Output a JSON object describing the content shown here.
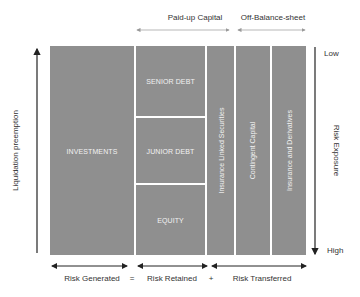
{
  "diagram": {
    "top_brackets": [
      {
        "label": "Paid-up  Capital"
      },
      {
        "label": "Off-Balance-sheet"
      }
    ],
    "left_axis": {
      "label": "Liquidation preemption"
    },
    "right_axis": {
      "label": "Risk Exposure",
      "top": "Low",
      "bottom": "High"
    },
    "blocks": {
      "investments": "INVESTMENTS",
      "senior_debt": "SENIOR DEBT",
      "junior_debt": "JUNIOR DEBT",
      "equity": "EQUITY",
      "ils": "Insurance Linked Securities",
      "contingent": "Contingent Capital",
      "derivatives": "Insurance and Derivatives"
    },
    "bottom": {
      "generated": "Risk Generated",
      "eq": "=",
      "retained": "Risk Retained",
      "plus": "+",
      "transferred": "Risk Transferred"
    },
    "colors": {
      "block": "#8f8f8f",
      "arrow": "#222222",
      "thin_arrow": "#999999"
    }
  }
}
